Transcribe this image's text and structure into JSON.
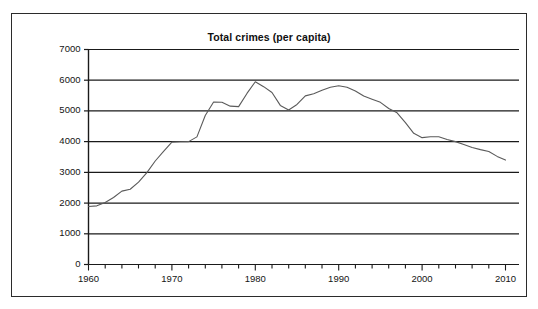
{
  "figure": {
    "title": "Total crimes (per capita)",
    "background_color": "#ffffff",
    "frame_color": "#2b2b2b",
    "gridline_color": "#1a1a1a",
    "axis_color": "#1a1a1a",
    "line_color": "#5a5a5a"
  },
  "chart_data": {
    "type": "line",
    "title": "Total crimes (per capita)",
    "xlabel": "",
    "ylabel": "",
    "xlim": [
      1960,
      2010
    ],
    "ylim": [
      0,
      7000
    ],
    "grid": true,
    "legend": null,
    "x_ticks": [
      1960,
      1970,
      1980,
      1990,
      2000,
      2010
    ],
    "x_tick_labels": [
      "1960",
      "1970",
      "1980",
      "1990",
      "2000",
      "2010"
    ],
    "x_minor_tick_step": 2,
    "y_ticks": [
      0,
      1000,
      2000,
      3000,
      4000,
      5000,
      6000,
      7000
    ],
    "y_tick_labels": [
      "0",
      "1000",
      "2000",
      "3000",
      "4000",
      "5000",
      "6000",
      "7000"
    ],
    "series": [
      {
        "name": "Total crimes (per capita)",
        "x": [
          1960,
          1961,
          1962,
          1963,
          1964,
          1965,
          1966,
          1967,
          1968,
          1969,
          1970,
          1971,
          1972,
          1973,
          1974,
          1975,
          1976,
          1977,
          1978,
          1979,
          1980,
          1981,
          1982,
          1983,
          1984,
          1985,
          1986,
          1987,
          1988,
          1989,
          1990,
          1991,
          1992,
          1993,
          1994,
          1995,
          1996,
          1997,
          1998,
          1999,
          2000,
          2001,
          2002,
          2003,
          2004,
          2005,
          2006,
          2007,
          2008,
          2009,
          2010
        ],
        "values": [
          1890,
          1910,
          2020,
          2180,
          2390,
          2450,
          2680,
          2990,
          3370,
          3680,
          3985,
          3995,
          4000,
          4155,
          4850,
          5290,
          5285,
          5155,
          5140,
          5570,
          5950,
          5790,
          5600,
          5180,
          5030,
          5210,
          5490,
          5560,
          5670,
          5770,
          5820,
          5770,
          5650,
          5485,
          5380,
          5280,
          5080,
          4940,
          4620,
          4270,
          4130,
          4160,
          4160,
          4070,
          4000,
          3910,
          3810,
          3740,
          3680,
          3520,
          3400
        ]
      }
    ]
  },
  "axes": {
    "y_labels": [
      {
        "text": "7000",
        "value": 7000
      },
      {
        "text": "6000",
        "value": 6000
      },
      {
        "text": "5000",
        "value": 5000
      },
      {
        "text": "4000",
        "value": 4000
      },
      {
        "text": "3000",
        "value": 3000
      },
      {
        "text": "2000",
        "value": 2000
      },
      {
        "text": "1000",
        "value": 1000
      },
      {
        "text": "0",
        "value": 0
      }
    ],
    "x_labels": [
      {
        "text": "1960",
        "value": 1960
      },
      {
        "text": "1970",
        "value": 1970
      },
      {
        "text": "1980",
        "value": 1980
      },
      {
        "text": "1990",
        "value": 1990
      },
      {
        "text": "2000",
        "value": 2000
      },
      {
        "text": "2010",
        "value": 2010
      }
    ]
  }
}
